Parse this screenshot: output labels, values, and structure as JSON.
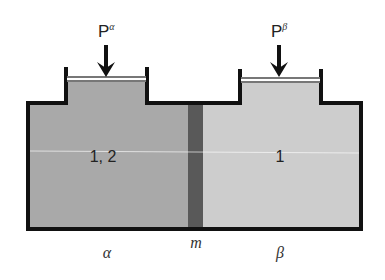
{
  "diagram": {
    "type": "two-phase membrane equilibrium",
    "pressures": {
      "alpha": {
        "base": "P",
        "superscript": "α"
      },
      "beta": {
        "base": "P",
        "superscript": "β"
      }
    },
    "compartments": {
      "alpha": {
        "content_label": "1, 2",
        "phase_label": "α",
        "fill": "#a9a9a9"
      },
      "beta": {
        "content_label": "1",
        "phase_label": "β",
        "fill": "#cdcdcd"
      }
    },
    "membrane": {
      "label": "m",
      "fill": "#595959"
    },
    "colors": {
      "wall": "#111111",
      "piston": "#666666",
      "background": "#ffffff"
    }
  }
}
